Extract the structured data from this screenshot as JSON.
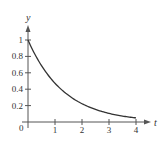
{
  "chart_data": {
    "type": "line",
    "title": "",
    "xlabel": "t",
    "ylabel": "y",
    "xlim": [
      0,
      4
    ],
    "ylim": [
      0,
      1
    ],
    "x_ticks": [
      1,
      2,
      3,
      4
    ],
    "x_tick_labels": [
      "1",
      "2",
      "3",
      "4"
    ],
    "y_ticks": [
      0.2,
      0.4,
      0.6,
      0.8,
      1
    ],
    "y_tick_labels": [
      "0.2",
      "0.4",
      "0.6",
      "0.8",
      "1"
    ],
    "origin_label": "0",
    "grid": false,
    "series": [
      {
        "name": "y = e^(-0.75t)",
        "x": [
          0,
          0.25,
          0.5,
          0.75,
          1,
          1.25,
          1.5,
          1.75,
          2,
          2.25,
          2.5,
          2.75,
          3,
          3.25,
          3.5,
          3.75,
          4
        ],
        "y": [
          1,
          0.829,
          0.687,
          0.57,
          0.472,
          0.392,
          0.325,
          0.269,
          0.223,
          0.185,
          0.153,
          0.127,
          0.105,
          0.087,
          0.072,
          0.06,
          0.05
        ]
      }
    ],
    "colors": {
      "axis": "#555555",
      "curve": "#333333",
      "text": "#333333"
    }
  }
}
